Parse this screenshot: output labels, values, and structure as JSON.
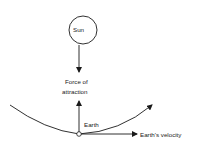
{
  "diagram": {
    "sun_label": "Sun",
    "force_label_line1": "Force of",
    "force_label_line2": "attraction",
    "earth_label": "Earth",
    "velocity_label": "Earth's velocity"
  }
}
